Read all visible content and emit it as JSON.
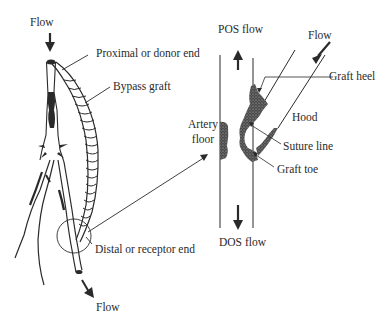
{
  "figure": {
    "left_panel": {
      "title": "Bypass graft overview",
      "labels": {
        "flow_in": "Flow",
        "proximal_end": "Proximal or donor end",
        "bypass_graft": "Bypass graft",
        "distal_end": "Distal or receptor end",
        "flow_out": "Flow"
      }
    },
    "right_panel": {
      "title": "Distal anastomosis detail",
      "labels": {
        "pos_flow": "POS flow",
        "flow": "Flow",
        "graft_heel": "Graft heel",
        "hood": "Hood",
        "artery_floor_line1": "Artery",
        "artery_floor_line2": "floor",
        "suture_line": "Suture line",
        "graft_toe": "Graft toe",
        "dos_flow": "DOS flow"
      }
    },
    "colors": {
      "ink": "#2a2a2a",
      "plaque": "#3a3a3a",
      "background": "#ffffff"
    }
  }
}
